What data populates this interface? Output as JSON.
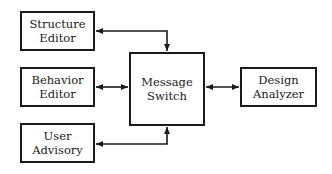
{
  "diagram": {
    "type": "block-diagram",
    "stroke_color": "#1a1a1a",
    "background_color": "#ffffff",
    "nodes": [
      {
        "id": "structure-editor",
        "lines": [
          "Structure",
          "Editor"
        ]
      },
      {
        "id": "behavior-editor",
        "lines": [
          "Behavior",
          "Editor"
        ]
      },
      {
        "id": "user-advisory",
        "lines": [
          "User",
          "Advisory"
        ]
      },
      {
        "id": "message-switch",
        "lines": [
          "Message",
          "Switch"
        ]
      },
      {
        "id": "design-analyzer",
        "lines": [
          "Design",
          "Analyzer"
        ]
      }
    ],
    "edges": [
      {
        "from": "message-switch",
        "to": "structure-editor",
        "direction": "bidirectional",
        "route": "up-then-left"
      },
      {
        "from": "behavior-editor",
        "to": "message-switch",
        "direction": "bidirectional",
        "route": "straight"
      },
      {
        "from": "message-switch",
        "to": "user-advisory",
        "direction": "bidirectional",
        "route": "down-then-left"
      },
      {
        "from": "message-switch",
        "to": "design-analyzer",
        "direction": "bidirectional",
        "route": "straight"
      }
    ]
  }
}
